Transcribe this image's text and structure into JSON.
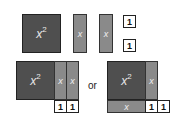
{
  "tiles": {
    "square_label": "x",
    "square_exponent": "2",
    "bar_label": "x",
    "unit_label": "1"
  },
  "connector": "or",
  "colors": {
    "square": "#4f4f4f",
    "bar": "#8a8a8a",
    "unit": "#ffffff",
    "border": "#222222"
  },
  "rows": {
    "top": [
      "x²",
      "x",
      "x",
      "1",
      "1"
    ],
    "bottom_left": [
      "x²",
      "x",
      "x",
      "1",
      "1"
    ],
    "bottom_right": [
      "x²",
      "x",
      "x",
      "1",
      "1"
    ]
  }
}
